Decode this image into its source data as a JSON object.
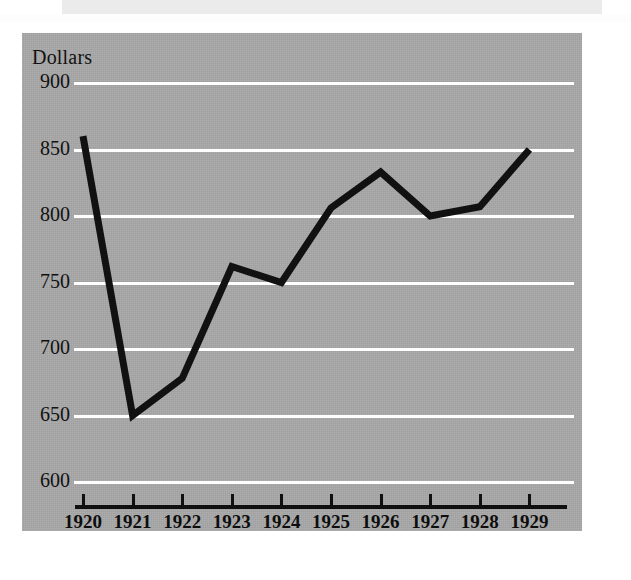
{
  "figure": {
    "background_color": "#a8a8a8",
    "gridline_color": "#ffffff",
    "series_color": "#111111",
    "axis_color": "#101010"
  },
  "chart_data": {
    "type": "line",
    "title": "",
    "subtitle": "",
    "xlabel": "",
    "ylabel": "Dollars",
    "categories": [
      "1920",
      "1921",
      "1922",
      "1923",
      "1924",
      "1925",
      "1926",
      "1927",
      "1928",
      "1929"
    ],
    "x": [
      1920,
      1921,
      1922,
      1923,
      1924,
      1925,
      1926,
      1927,
      1928,
      1929
    ],
    "values": [
      860,
      650,
      678,
      762,
      750,
      806,
      833,
      800,
      807,
      850
    ],
    "series": [
      {
        "name": "Dollars",
        "values": [
          860,
          650,
          678,
          762,
          750,
          806,
          833,
          800,
          807,
          850
        ]
      }
    ],
    "ylim": [
      580,
      915
    ],
    "yticks": [
      900,
      850,
      800,
      750,
      700,
      650,
      600
    ],
    "ytick_labels": [
      "900",
      "850",
      "800",
      "750",
      "700",
      "650",
      "600"
    ],
    "xtick_labels": [
      "1920",
      "1921",
      "1922",
      "1923",
      "1924",
      "1925",
      "1926",
      "1927",
      "1928",
      "1929"
    ],
    "grid": true,
    "grid_axis": "y",
    "legend": false,
    "legend_position": "none",
    "annotations": []
  }
}
